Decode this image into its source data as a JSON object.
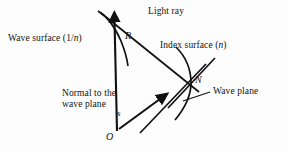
{
  "figure": {
    "background_color": "#fdfdfd",
    "stroke_color": "#111111",
    "text_color": "#111111"
  },
  "labels": {
    "wave_surface": "Wave surface (1/n)",
    "wave_surface_plain": "Wave surface (1/",
    "wave_surface_italic": "n",
    "wave_surface_close": ")",
    "light_ray": "Light ray",
    "index_surface_plain": "Index surface (",
    "index_surface_italic": "n",
    "index_surface_close": ")",
    "wave_plane": "Wave plane",
    "normal_line1": "Normal to the",
    "normal_line2": "wave plane"
  },
  "points": {
    "R": "R",
    "N": "N",
    "O": "O",
    "s": "s"
  },
  "geometry": {
    "origin": {
      "x": 117,
      "y": 130
    },
    "R": {
      "x": 119,
      "y": 38
    },
    "N": {
      "x": 190,
      "y": 83
    },
    "light_ray_tip": {
      "x": 114,
      "y": 14
    },
    "s_arrow_tip": {
      "x": 166,
      "y": 94
    }
  }
}
